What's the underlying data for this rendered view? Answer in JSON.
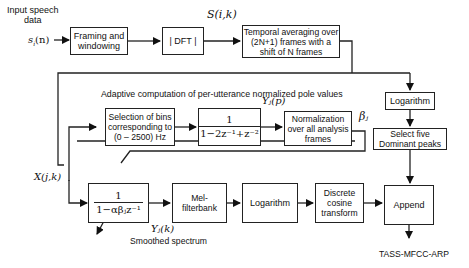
{
  "diagram": {
    "input": {
      "label_line1": "Input speech",
      "label_line2": "data",
      "signal": "s",
      "signal_sub": "i",
      "signal_arg": "(n)"
    },
    "blocks": {
      "framing": "Framing and windowing",
      "dft": "| DFT |",
      "temporal_averaging": "Temporal averaging over (2N+1) frames with a shift of N frames",
      "selection_bins": "Selection of bins corresponding to (0 – 2500) Hz",
      "pole_filter": {
        "numerator": "1",
        "denominator": "1−2z⁻¹+z⁻²"
      },
      "normalization": "Normalization over all analysis frames",
      "logarithm_right": "Logarithm",
      "select_peaks": "Select five Dominant peaks",
      "smoothing_filter": {
        "numerator": "1",
        "denominator": "1−αβⱼz⁻¹"
      },
      "mel_filterbank": "Mel-filterbank",
      "logarithm_bottom": "Logarithm",
      "dct": "Discrete cosine transform",
      "append": "Append"
    },
    "signals": {
      "s_ik": "S(i,k)",
      "x_jk": "X(j,k)",
      "y_jp": "Yⱼ(p)",
      "beta_j": "βⱼ",
      "y_jk": "Yⱼ(k)"
    },
    "annotations": {
      "adaptive_title": "Adaptive computation of per-utterance normalized pole values",
      "smoothed_spectrum": "Smoothed spectrum",
      "output": "TASS-MFCC-ARP"
    },
    "colors": {
      "line": "#222222",
      "background": "#ffffff"
    }
  }
}
